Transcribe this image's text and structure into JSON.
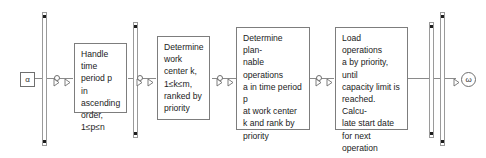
{
  "diagram": {
    "type": "event-driven-process-chain",
    "start_terminal": {
      "label": "α",
      "name": "start-node"
    },
    "end_terminal": {
      "label": "ω",
      "name": "end-node"
    },
    "steps": [
      {
        "id": "step-1",
        "text": "Handle time\nperiod p in\nascending\norder,\n1≤p≤n"
      },
      {
        "id": "step-2",
        "text": "Determine\nwork\ncenter k,\n1≤k≤m,\nranked by\npriority"
      },
      {
        "id": "step-3",
        "text": "Determine plan-\nnable operations\na in time period p\nat work center\nk and rank by\npriority"
      },
      {
        "id": "step-4",
        "text": "Load operations\na by priority, until\ncapacity limit is\nreached. Calcu-\nlate start date\nfor next operation"
      }
    ],
    "connectors": [
      {
        "id": "connector-1",
        "glyphs": "triangle-circle-triangle"
      },
      {
        "id": "connector-2",
        "glyphs": "triangle-circle-triangle"
      },
      {
        "id": "connector-3",
        "glyphs": "triangle-circle-triangle"
      },
      {
        "id": "connector-4",
        "glyphs": "triangle-circle-triangle"
      },
      {
        "id": "connector-end",
        "glyphs": "triangle"
      }
    ],
    "sync_bars": [
      {
        "id": "sync-bar-1",
        "dots": 2
      },
      {
        "id": "sync-bar-2",
        "dots": 2
      },
      {
        "id": "sync-bar-3",
        "dots": 2
      },
      {
        "id": "sync-bar-4",
        "dots": 2
      }
    ],
    "colors": {
      "line": "#8a8a8a",
      "box_border": "#7d7d7d",
      "bar_border": "#9a9a9a",
      "dot": "#1d1d1d",
      "text": "#1b1b1b",
      "background": "#ffffff"
    }
  }
}
